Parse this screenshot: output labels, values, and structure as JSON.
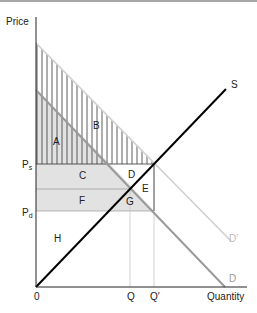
{
  "diagram": {
    "axes": {
      "y_label": "Price",
      "x_label": "Quantity",
      "origin_label": "0"
    },
    "price_levels": {
      "ps": {
        "main": "P",
        "sub": "s"
      },
      "pd": {
        "main": "P",
        "sub": "d"
      }
    },
    "quantity_levels": {
      "q": "Q",
      "q_prime": "Q′"
    },
    "curves": {
      "supply": "S",
      "demand": "D",
      "demand_shifted": "D′"
    },
    "areas": {
      "a": "A",
      "b": "B",
      "c": "C",
      "d": "D",
      "e": "E",
      "f": "F",
      "g": "G",
      "h": "H"
    },
    "colors": {
      "supply_line": "#000000",
      "demand_line": "#9a9a9a",
      "demand_shifted_line": "#c8c8c8",
      "shaded_fill": "#e2e2e2",
      "hatch": "#222222",
      "top_border": "#a8a8a8"
    }
  }
}
